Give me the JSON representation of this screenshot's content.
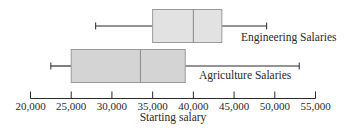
{
  "chart_data": {
    "type": "boxplot",
    "title": "",
    "xlabel": "Starting salary",
    "ylabel": "",
    "xlim": [
      20000,
      55000
    ],
    "grid": false,
    "legend": "none (series labeled inline beside boxes)",
    "x_ticks": [
      20000,
      25000,
      30000,
      35000,
      40000,
      45000,
      50000,
      55000
    ],
    "x_tick_labels": [
      "20,000",
      "25,000",
      "30,000",
      "35,000",
      "40,000",
      "45,000",
      "50,000",
      "55,000"
    ],
    "series": [
      {
        "name": "Engineering Salaries",
        "min": 28000,
        "q1": 35000,
        "median": 40000,
        "q3": 43500,
        "max": 49000,
        "box_color": "#e2e2e2"
      },
      {
        "name": "Agriculture Salaries",
        "min": 22500,
        "q1": 25000,
        "median": 33500,
        "q3": 39000,
        "max": 53000,
        "box_color": "#d4d4d4"
      }
    ]
  },
  "colors": {
    "line": "#2a2a2a",
    "box_edge": "#9a9a9a",
    "median": "#8a8a8a"
  }
}
